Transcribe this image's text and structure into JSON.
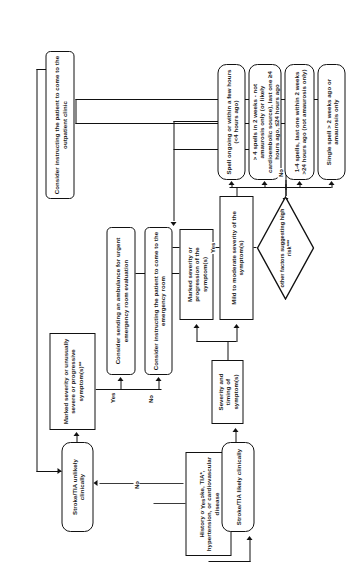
{
  "diagram": {
    "orientation": "rotated-90",
    "nodes": {
      "history": "History of stroke, TIA*, hypertension, or cardiovascular disease",
      "unlikely": "Stroke/TIA unlikely clinically",
      "likely": "Stroke/TIA likely clinically",
      "marked_unusual": "Marked severity or unusually severe or progressive symptom(s)**",
      "severity_timing": "Severity and timing of symptom(s)",
      "marked_progression": "Marked severity or progression of the symptom(s)",
      "mild_moderate": "Mild to moderate severity of the symptom(s)",
      "spell_ongoing": "Spell ongoing or within a few hours (<4 hours ago)",
      "spells_gt4": "> 4 spells in 2 weeks - not amaurosis only (or likely cardioembolic source), last one ≥4 hours ago, ≤24 hours ago",
      "spells_1_4": "1-4 spells, last one within 2 weeks >24 hours ago (not amaurosis only)",
      "single_spell": "Single spell > 2 weeks ago or amaurosis only",
      "high_risk": "other factors suggesting high risk***",
      "ambulance": "Consider sending an ambulance for urgent emergency room evaluation",
      "er": "Consider instructing the patient to come to the emergency room",
      "clinic": "Consider instructing the patient to come to the outpatient clinic"
    },
    "edges": {
      "yes1": "Yes",
      "no1": "No",
      "yes2": "Yes",
      "no2": "No",
      "yes3": "Yes",
      "no3": "No"
    }
  }
}
